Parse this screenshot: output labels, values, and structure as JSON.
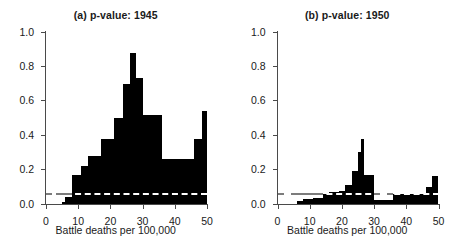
{
  "figure": {
    "xlabel": "Battle deaths per 100,000",
    "ytick_labels": [
      "0.0",
      "0.2",
      "0.4",
      "0.6",
      "0.8",
      "1.0"
    ],
    "xtick_labels": [
      "0",
      "10",
      "20",
      "30",
      "40",
      "50"
    ]
  },
  "chart_data": [
    {
      "type": "bar",
      "panel": "a",
      "title": "(a) p-value: 1945",
      "xlabel": "Battle deaths per 100,000",
      "ylabel": "",
      "xlim": [
        0,
        50
      ],
      "ylim": [
        0.0,
        1.0
      ],
      "xticks": [
        0,
        10,
        20,
        30,
        40,
        50
      ],
      "yticks": [
        0.0,
        0.2,
        0.4,
        0.6,
        0.8,
        1.0
      ],
      "grid": false,
      "legend": "none",
      "annotations": [
        {
          "name": "significance-threshold",
          "type": "hline",
          "y": 0.05,
          "style": "dashed",
          "color": "#ffffff"
        }
      ],
      "bin_edges": [
        0,
        5,
        6,
        8,
        11,
        13,
        17,
        21,
        24,
        26,
        28,
        30,
        36,
        46,
        48.5,
        50
      ],
      "values": [
        0.0,
        0.01,
        0.04,
        0.17,
        0.22,
        0.28,
        0.38,
        0.5,
        0.7,
        0.88,
        0.73,
        0.52,
        0.26,
        0.38,
        0.54
      ]
    },
    {
      "type": "bar",
      "panel": "b",
      "title": "(b) p-value: 1950",
      "xlabel": "Battle deaths per 100,000",
      "ylabel": "",
      "xlim": [
        0,
        50
      ],
      "ylim": [
        0.0,
        1.0
      ],
      "xticks": [
        0,
        10,
        20,
        30,
        40,
        50
      ],
      "yticks": [
        0.0,
        0.2,
        0.4,
        0.6,
        0.8,
        1.0
      ],
      "grid": false,
      "legend": "none",
      "annotations": [
        {
          "name": "significance-threshold",
          "type": "hline",
          "y": 0.05,
          "style": "dashed",
          "color": "#ffffff"
        }
      ],
      "bin_edges": [
        0,
        6,
        8,
        11,
        14,
        16,
        19,
        21,
        23,
        24,
        25,
        26,
        27,
        28,
        30,
        36,
        46,
        48,
        50
      ],
      "values": [
        0.0,
        0.015,
        0.03,
        0.035,
        0.06,
        0.07,
        0.075,
        0.11,
        0.19,
        0.19,
        0.3,
        0.38,
        0.17,
        0.17,
        0.025,
        0.06,
        0.1,
        0.16
      ]
    }
  ],
  "panels": [
    {
      "id": "a",
      "title": "(a) p-value: 1945"
    },
    {
      "id": "b",
      "title": "(b) p-value: 1950"
    }
  ]
}
